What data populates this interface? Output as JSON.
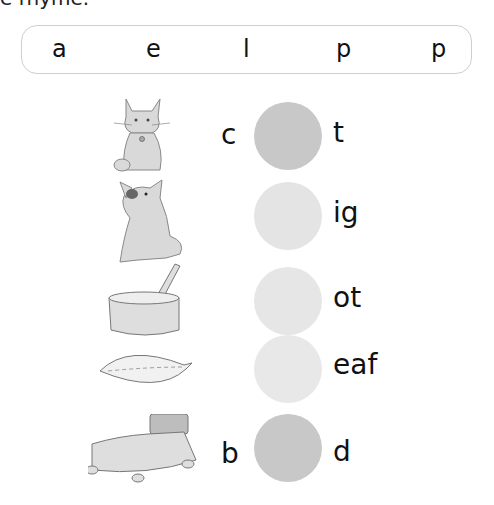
{
  "header": {
    "clipped_instruction": "e rhyme."
  },
  "letter_bank": {
    "letters": [
      "a",
      "e",
      "l",
      "p",
      "p"
    ]
  },
  "colors": {
    "filled_circle": "#c8c8c8",
    "empty_circle": "#e4e4e4",
    "bank_border": "#cfcfcf"
  },
  "rows": [
    {
      "picture": "cat",
      "onset": "c",
      "rime": "t",
      "circle_state": "filled"
    },
    {
      "picture": "pig",
      "onset": "",
      "rime": "ig",
      "circle_state": "empty"
    },
    {
      "picture": "pot",
      "onset": "",
      "rime": "ot",
      "circle_state": "empty"
    },
    {
      "picture": "leaf",
      "onset": "",
      "rime": "eaf",
      "circle_state": "empty"
    },
    {
      "picture": "bed",
      "onset": "b",
      "rime": "d",
      "circle_state": "filled"
    }
  ]
}
